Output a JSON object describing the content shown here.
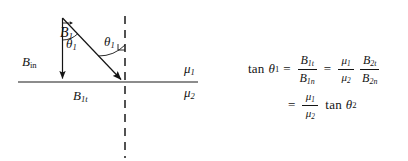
{
  "figure": {
    "type": "physics-vector-diagram",
    "interface_line": {
      "orientation": "horizontal",
      "style": "solid",
      "x_start": 18,
      "x_end": 198,
      "y": 82
    },
    "normal_line": {
      "orientation": "vertical",
      "style": "dashed",
      "x": 125,
      "y_start": 16,
      "y_end": 158,
      "dash": "7 6"
    },
    "vectors": [
      {
        "name": "B1-resultant",
        "label": "B",
        "subscript": "1",
        "has_vector_arrow": true,
        "from": [
          62,
          18
        ],
        "to": [
          124,
          82
        ],
        "label_x": 60,
        "label_y": 26
      },
      {
        "name": "B1n-normal-component",
        "label": "B",
        "subscript": "in",
        "has_vector_arrow": false,
        "from": [
          62,
          18
        ],
        "to": [
          62,
          82
        ],
        "label_x": 22,
        "label_y": 55
      },
      {
        "name": "B1t-tangential-component",
        "label": "B",
        "subscript": "1t",
        "has_vector_arrow": false,
        "from": [
          62,
          82
        ],
        "to": [
          124,
          82
        ],
        "label_x": 73,
        "label_y": 89
      }
    ],
    "angles": [
      {
        "name": "theta1-at-apex",
        "symbol": "θ",
        "subscript": "1",
        "vertex": [
          62,
          18
        ],
        "label_x": 66,
        "label_y": 37
      },
      {
        "name": "theta1-at-interface",
        "symbol": "θ",
        "subscript": "1",
        "vertex": [
          124,
          82
        ],
        "label_x": 104,
        "label_y": 35
      }
    ],
    "media_labels": [
      {
        "name": "mu1-upper-medium",
        "symbol": "μ",
        "subscript": "1",
        "position": "above-interface"
      },
      {
        "name": "mu2-lower-medium",
        "symbol": "μ",
        "subscript": "2",
        "position": "below-interface"
      }
    ],
    "colors": {
      "ink": "#141414",
      "line": "#1a1a1a",
      "background": "#ffffff"
    }
  },
  "equations": {
    "line1": {
      "lhs_fn": "tan",
      "lhs_symbol": "θ",
      "lhs_sub": "1",
      "eq1": "=",
      "frac1_num_base": "B",
      "frac1_num_sub": "1t",
      "frac1_den_base": "B",
      "frac1_den_sub": "1n",
      "eq2": "=",
      "frac2_num_base": "μ",
      "frac2_num_sub": "1",
      "frac2_den_base": "μ",
      "frac2_den_sub": "2",
      "frac3_num_base": "B",
      "frac3_num_sub": "2t",
      "frac3_den_base": "B",
      "frac3_den_sub": "2n",
      "plain": "tan θ₁ = B₁ₜ / B₁ₙ = (μ₁/μ₂)(B₂ₜ/B₂ₙ)"
    },
    "line2": {
      "eq": "=",
      "frac_num_base": "μ",
      "frac_num_sub": "1",
      "frac_den_base": "μ",
      "frac_den_sub": "2",
      "fn": "tan",
      "symbol": "θ",
      "sub": "2",
      "plain": "= (μ₁/μ₂) tan θ₂"
    }
  },
  "labels": {
    "b1_base": "B",
    "b1_sub": "1",
    "bin_base": "B",
    "bin_sub": "in",
    "b1t_base": "B",
    "b1t_sub": "1t",
    "theta_a_base": "θ",
    "theta_a_sub": "1",
    "theta_b_base": "θ",
    "theta_b_sub": "1",
    "mu1_base": "μ",
    "mu1_sub": "1",
    "mu2_base": "μ",
    "mu2_sub": "2"
  }
}
